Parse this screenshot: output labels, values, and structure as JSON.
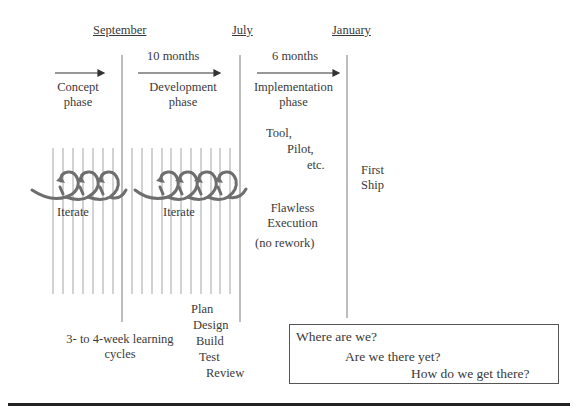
{
  "timeline": {
    "months": [
      "September",
      "July",
      "January"
    ],
    "durations": [
      "10 months",
      "6 months"
    ]
  },
  "phases": [
    {
      "name_line1": "Concept",
      "name_line2": "phase",
      "loop_label": "Iterate",
      "loops": 3
    },
    {
      "name_line1": "Development",
      "name_line2": "phase",
      "loop_label": "Iterate",
      "loops": 4
    },
    {
      "name_line1": "Implementation",
      "name_line2": "phase"
    }
  ],
  "implementation_notes": {
    "items": [
      "Tool,",
      "Pilot,",
      "etc."
    ],
    "flawless_line1": "Flawless",
    "flawless_line2": "Execution",
    "no_rework": "(no rework)"
  },
  "milestone": {
    "line1": "First",
    "line2": "Ship"
  },
  "learning_cycles": {
    "line1": "3- to 4-week learning",
    "line2": "cycles"
  },
  "cycle_steps": [
    "Plan",
    "Design",
    "Build",
    "Test",
    "Review"
  ],
  "questions": [
    "Where are we?",
    "Are we there yet?",
    "How do we get there?"
  ],
  "colors": {
    "line": "#9a9a9a",
    "loop": "#6e6e6e",
    "text": "#3a3a3a"
  }
}
